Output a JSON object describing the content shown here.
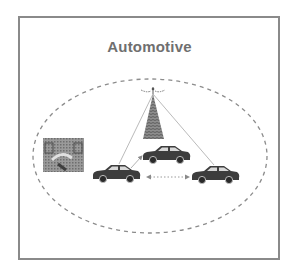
{
  "diagram": {
    "title": "Automotive",
    "colors": {
      "frame": "#8a8a8a",
      "title": "#6f6f6f",
      "ellipse": "#8c8c8c",
      "car": "#3d3d3d",
      "antenna": "#5a5a5a",
      "link": "#a0a0a0"
    },
    "nodes": [
      {
        "id": "antenna",
        "type": "cell-tower-icon"
      },
      {
        "id": "infrastructure",
        "type": "dashboard-photo-icon"
      },
      {
        "id": "car-left",
        "type": "car-icon"
      },
      {
        "id": "car-middle",
        "type": "car-icon"
      },
      {
        "id": "car-right",
        "type": "car-icon"
      }
    ],
    "links": [
      {
        "from": "antenna",
        "to": "car-left",
        "style": "thin"
      },
      {
        "from": "antenna",
        "to": "car-right",
        "style": "thin"
      },
      {
        "from": "car-left",
        "to": "car-middle",
        "style": "arrow"
      },
      {
        "from": "car-left",
        "to": "car-right",
        "style": "dotted-double-arrow"
      }
    ]
  }
}
